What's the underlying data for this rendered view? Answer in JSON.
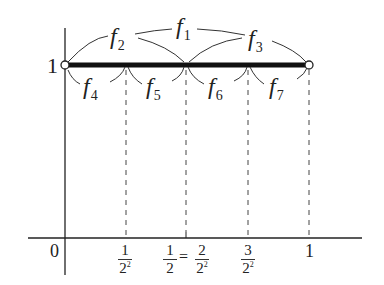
{
  "figure": {
    "colors": {
      "line": "#222222",
      "dashed": "#444444",
      "background": "#ffffff"
    },
    "y_label": "1",
    "origin_label": "0",
    "arc_labels": {
      "f1": {
        "letter": "f",
        "sub": "1"
      },
      "f2": {
        "letter": "f",
        "sub": "2"
      },
      "f3": {
        "letter": "f",
        "sub": "3"
      },
      "f4": {
        "letter": "f",
        "sub": "4"
      },
      "f5": {
        "letter": "f",
        "sub": "5"
      },
      "f6": {
        "letter": "f",
        "sub": "6"
      },
      "f7": {
        "letter": "f",
        "sub": "7"
      }
    },
    "x_ticks": {
      "t1": {
        "num": "1",
        "den": "2",
        "exp": "2"
      },
      "t2a": {
        "num": "1",
        "den": "2"
      },
      "t2eq": "=",
      "t2b": {
        "num": "2",
        "den": "2",
        "exp": "2"
      },
      "t3": {
        "num": "3",
        "den": "2",
        "exp": "2"
      },
      "t4": "1"
    }
  }
}
